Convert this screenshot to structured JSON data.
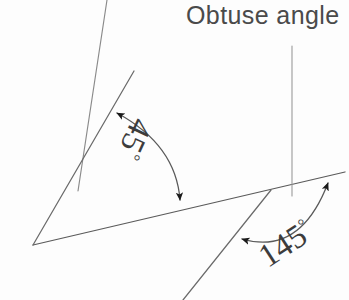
{
  "figure": {
    "title_caption": "Obtuse angle",
    "background_color": "#fdfdfd",
    "stroke_color": "#5a5a5a",
    "text_color": "#4a4a4a",
    "ink_color": "#3c3c3c",
    "width": 349,
    "height": 300
  },
  "labels": {
    "acute_angle_value": "45",
    "acute_angle_degree_symbol": "°",
    "obtuse_angle_value": "145",
    "obtuse_angle_degree_symbol": "°",
    "caption": "Obtuse angle"
  },
  "geometry": {
    "acute_angle_degrees": 45,
    "obtuse_angle_degrees": 145,
    "acute_vertex": [
      33,
      245
    ],
    "obtuse_vertex": [
      270,
      190
    ],
    "baseline_start": [
      33,
      245
    ],
    "baseline_end": [
      345,
      172
    ],
    "ray_upper_left_start": [
      107,
      0
    ],
    "ray_upper_left_end": [
      78,
      190
    ],
    "ray_oblique_start": [
      133,
      72
    ],
    "ray_oblique_end": [
      33,
      245
    ],
    "ray_lower_right_start": [
      270,
      190
    ],
    "ray_lower_right_end": [
      183,
      300
    ],
    "leader_line_start": [
      292,
      46
    ],
    "leader_line_end": [
      292,
      195
    ],
    "acute_arc_start": [
      115,
      112
    ],
    "acute_arc_end": [
      180,
      203
    ],
    "obtuse_arc_start": [
      240,
      238
    ],
    "obtuse_arc_end": [
      332,
      180
    ]
  }
}
